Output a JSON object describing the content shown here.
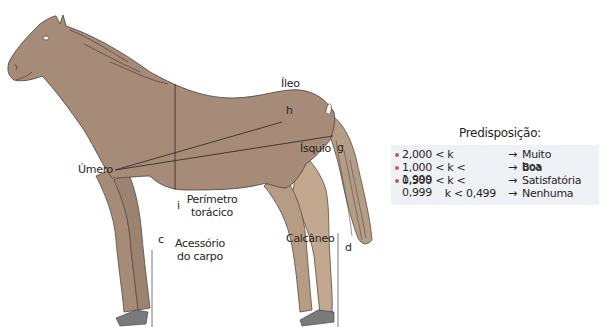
{
  "diagram": {
    "colors": {
      "horse_body": "#a68c78",
      "horse_legs_hind": "#c2a88f",
      "outline": "#5a4a3e",
      "measure_line": "#3a2e26",
      "hoof": "#7a7a7a",
      "legend_bg": "#eef2f6",
      "bullet": "#c0604a"
    },
    "labels": {
      "ileo": "Íleo",
      "h": "h",
      "isquio": "Ísquio",
      "g": "g",
      "umero": "Úmero",
      "i": "i",
      "perimetro_line1": "Perímetro",
      "perimetro_line2": "torácico",
      "c": "c",
      "acessorio_line1": "Acessório",
      "acessorio_line2": "do carpo",
      "calcaneo": "Calcâneo",
      "d": "d"
    }
  },
  "legend": {
    "title": "Predisposição:",
    "rows": [
      {
        "bullet": true,
        "condition": "2,000 < k",
        "arrow": "→",
        "result": "Muito boa"
      },
      {
        "bullet": true,
        "condition": "1,000 < k < 1,999",
        "arrow": "→",
        "result": "Boa"
      },
      {
        "bullet": true,
        "condition": "0,500 < k < 0,999",
        "arrow": "→",
        "result": "Satisfatória"
      },
      {
        "bullet": false,
        "condition": "k < 0,499",
        "arrow": "→",
        "result": "Nenhuma"
      }
    ]
  }
}
